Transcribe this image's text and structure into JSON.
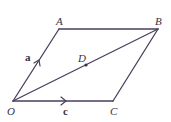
{
  "diagram": {
    "points": {
      "O": "O",
      "A": "A",
      "B": "B",
      "C": "C",
      "D": "D"
    },
    "vectors": {
      "a": "a",
      "c": "c"
    },
    "edges": [
      "OA",
      "AB",
      "BC",
      "CO",
      "OB"
    ],
    "color": "#4a3f5c"
  }
}
